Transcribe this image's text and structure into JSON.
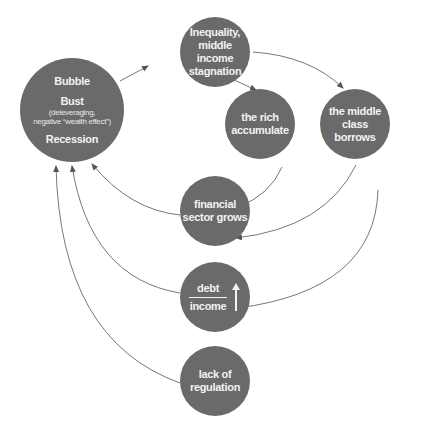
{
  "diagram": {
    "type": "causal-cycle",
    "colors": {
      "node_fill": "#6a6a6a",
      "node_text": "#f2f2f2",
      "arrow": "#666666",
      "background": "#ffffff"
    },
    "nodes": {
      "crisis": {
        "line1": "Bubble",
        "line2": "Bust",
        "sub1": "(deleveraging,",
        "sub2": "negative “wealth effect”)",
        "line3": "Recession"
      },
      "inequality": {
        "line1": "Inequality,",
        "line2": "middle income",
        "line3": "stagnation"
      },
      "rich": {
        "line1": "the rich",
        "line2": "accumulate"
      },
      "middle_class": {
        "line1": "the middle",
        "line2": "class borrows"
      },
      "financial": {
        "line1": "financial",
        "line2": "sector grows"
      },
      "debt_income": {
        "numerator": "debt",
        "denominator": "income",
        "arrow": "up-arrow"
      },
      "regulation": {
        "line1": "lack of",
        "line2": "regulation"
      }
    },
    "edges": [
      {
        "from": "crisis",
        "to": "inequality"
      },
      {
        "from": "inequality",
        "to": "rich"
      },
      {
        "from": "inequality",
        "to": "middle_class"
      },
      {
        "from": "rich",
        "to": "financial"
      },
      {
        "from": "middle_class",
        "to": "financial"
      },
      {
        "from": "middle_class",
        "to": "debt_income"
      },
      {
        "from": "financial",
        "to": "crisis"
      },
      {
        "from": "debt_income",
        "to": "crisis"
      },
      {
        "from": "regulation",
        "to": "crisis"
      }
    ]
  }
}
